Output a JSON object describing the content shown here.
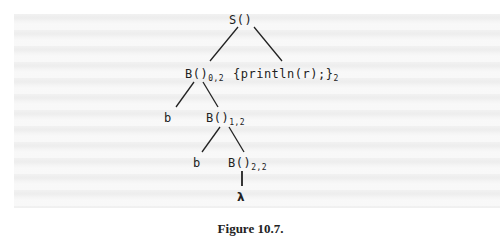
{
  "figure": {
    "caption": "Figure 10.7.",
    "tree": {
      "root": {
        "label": "S()",
        "sub": ""
      },
      "level1": [
        {
          "label": "B()",
          "sub": "0,2"
        },
        {
          "label": "{println(r);}",
          "sub": "2"
        }
      ],
      "level2": [
        {
          "label": "b",
          "sub": ""
        },
        {
          "label": "B()",
          "sub": "1,2"
        }
      ],
      "level3": [
        {
          "label": "b",
          "sub": ""
        },
        {
          "label": "B()",
          "sub": "2,2"
        }
      ],
      "level4": [
        {
          "label": "λ",
          "sub": ""
        }
      ]
    }
  }
}
